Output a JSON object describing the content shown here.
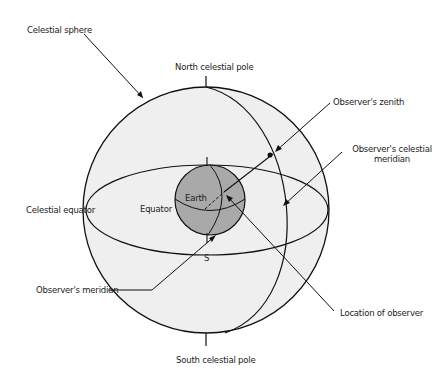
{
  "diagram": {
    "colors": {
      "sphere_fill": "#efefef",
      "earth_fill": "#a9a9a9",
      "line": "#111111",
      "background": "#ffffff"
    },
    "labels": {
      "celestial_sphere": "Celestial sphere",
      "north_celestial_pole": "North celestial pole",
      "observers_zenith": "Observer's zenith",
      "observers_celestial_meridian_line1": "Observer's celestial",
      "observers_celestial_meridian_line2": "meridian",
      "celestial_equator": "Celestial equator",
      "equator": "Equator",
      "earth": "Earth",
      "s": "S",
      "observers_meridian": "Observer's meridian",
      "location_of_observer": "Location of observer",
      "south_celestial_pole": "South celestial pole"
    }
  }
}
